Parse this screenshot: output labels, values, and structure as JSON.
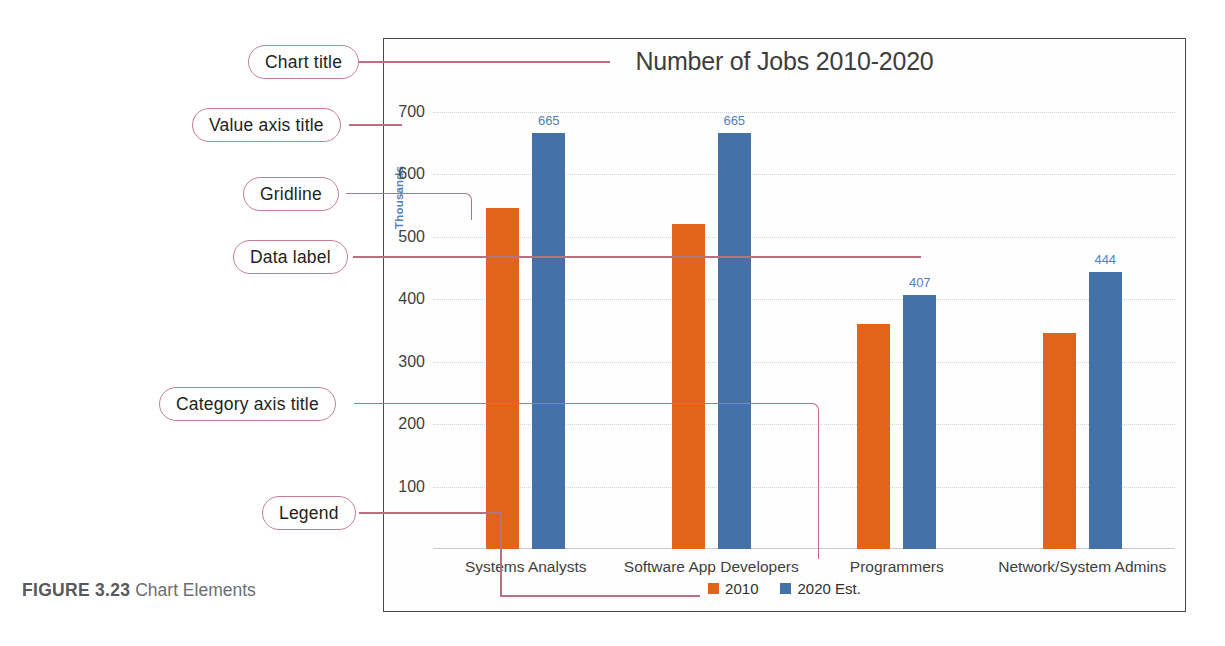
{
  "figure": {
    "number": "FIGURE 3.23",
    "caption": "Chart Elements"
  },
  "callouts": [
    {
      "id": "chart-title",
      "label": "Chart title"
    },
    {
      "id": "value-axis-title",
      "label": "Value axis title"
    },
    {
      "id": "gridline",
      "label": "Gridline"
    },
    {
      "id": "data-label",
      "label": "Data label"
    },
    {
      "id": "category-axis-title",
      "label": "Category axis title"
    },
    {
      "id": "legend",
      "label": "Legend"
    }
  ],
  "chart_data": {
    "type": "bar",
    "title": "Number of Jobs 2010-2020",
    "xlabel": "Job Titles",
    "ylabel": "Thousands",
    "categories": [
      "Systems Analysts",
      "Software App Developers",
      "Programmers",
      "Network/System Admins"
    ],
    "series": [
      {
        "name": "2010",
        "color": "#e2641a",
        "values": [
          545,
          520,
          360,
          345
        ]
      },
      {
        "name": "2020 Est.",
        "color": "#4472a8",
        "values": [
          665,
          665,
          407,
          444
        ]
      }
    ],
    "data_labels": [
      {
        "category": "Systems Analysts",
        "series": "2020 Est.",
        "value": "665"
      },
      {
        "category": "Software App Developers",
        "series": "2020 Est.",
        "value": "665"
      },
      {
        "category": "Programmers",
        "series": "2020 Est.",
        "value": "407"
      },
      {
        "category": "Network/System Admins",
        "series": "2020 Est.",
        "value": "444"
      }
    ],
    "yticks": [
      "700",
      "600",
      "500",
      "400",
      "300",
      "200",
      "100"
    ],
    "ylim": [
      0,
      720
    ],
    "grid": true,
    "legend_position": "bottom",
    "legend": [
      "2010",
      "2020 Est."
    ]
  },
  "colors": {
    "series_2010": "#e2641a",
    "series_2020": "#4472a8",
    "axis_title": "#4f81bd",
    "callout_outline": "#c4808f",
    "leader_line": "#b9707f",
    "chart_border": "#4a4a4a"
  }
}
